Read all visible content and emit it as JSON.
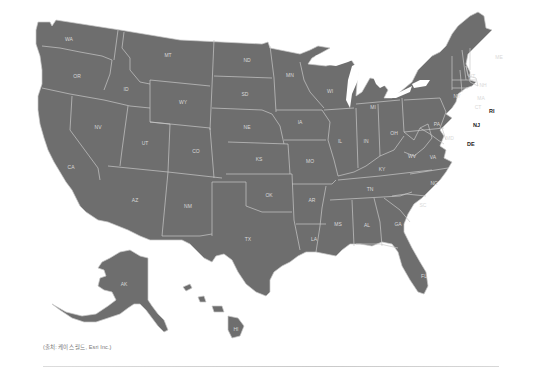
{
  "map": {
    "title": "United States state map",
    "fill_color": "#6e6e6e",
    "border_color": "#c9c9c9",
    "label_color": "#d9d9d9",
    "states": {
      "WA": "WA",
      "OR": "OR",
      "CA": "CA",
      "ID": "ID",
      "NV": "NV",
      "MT": "MT",
      "WY": "WY",
      "UT": "UT",
      "AZ": "AZ",
      "CO": "CO",
      "NM": "NM",
      "ND": "ND",
      "SD": "SD",
      "NE": "NE",
      "KS": "KS",
      "OK": "OK",
      "TX": "TX",
      "MN": "MN",
      "IA": "IA",
      "MO": "MO",
      "AR": "AR",
      "LA": "LA",
      "WI": "WI",
      "IL": "IL",
      "MI": "MI",
      "IN": "IN",
      "OH": "OH",
      "KY": "KY",
      "TN": "TN",
      "MS": "MS",
      "AL": "AL",
      "GA": "GA",
      "FL": "FL",
      "SC": "SC",
      "NC": "NC",
      "VA": "VA",
      "WV": "WV",
      "PA": "PA",
      "NY": "NY",
      "VT": "VT",
      "NH": "NH",
      "ME": "ME",
      "MA": "MA",
      "CT": "CT",
      "RI": "RI",
      "NJ": "NJ",
      "DE": "DE",
      "MD": "MD",
      "AK": "AK",
      "HI": "HI"
    }
  },
  "caption": "(출처: 케이스 월드, Esri Inc.)"
}
